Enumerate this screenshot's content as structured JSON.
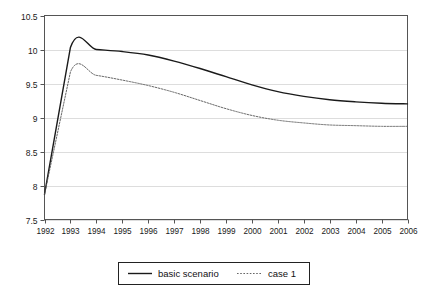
{
  "chart_data": {
    "type": "line",
    "title": "",
    "subtitle": "",
    "xlabel": "",
    "ylabel": "",
    "x": [
      1992,
      1993,
      1994,
      1995,
      1996,
      1997,
      1998,
      1999,
      2000,
      2001,
      2002,
      2003,
      2004,
      2005,
      2006
    ],
    "categories": [
      "1992",
      "1993",
      "1994",
      "1995",
      "1996",
      "1997",
      "1998",
      "1999",
      "2000",
      "2001",
      "2002",
      "2003",
      "2004",
      "2005",
      "2006"
    ],
    "xlim": [
      1992,
      2006
    ],
    "ylim": [
      7.5,
      10.5
    ],
    "ytick_labels": [
      "10.5",
      "10",
      "9.5",
      "9",
      "8.5",
      "8",
      "7.5"
    ],
    "ytick_values": [
      10.5,
      10,
      9.5,
      9,
      8.5,
      8,
      7.5
    ],
    "grid": true,
    "grid_axis": "y",
    "grid_style": "dotted",
    "legend_position": "bottom-center",
    "series": [
      {
        "name": "basic scenario",
        "style": "solid",
        "color": "#1a1a1a",
        "width": 1.4,
        "values": [
          7.87,
          10.03,
          10.0,
          9.97,
          9.92,
          9.83,
          9.72,
          9.6,
          9.48,
          9.38,
          9.31,
          9.26,
          9.23,
          9.21,
          9.2
        ]
      },
      {
        "name": "case 1",
        "style": "dotted",
        "color": "#555555",
        "width": 0.9,
        "values": [
          7.87,
          9.67,
          9.62,
          9.55,
          9.47,
          9.37,
          9.25,
          9.13,
          9.03,
          8.96,
          8.92,
          8.89,
          8.88,
          8.87,
          8.87
        ]
      }
    ]
  },
  "legend": {
    "entries": [
      {
        "label": "basic scenario"
      },
      {
        "label": "case 1"
      }
    ]
  },
  "colors": {
    "axis": "#555555",
    "grid": "#aaaaaa",
    "series_1": "#1a1a1a",
    "series_2": "#666666",
    "text": "#111111",
    "background": "#ffffff"
  }
}
